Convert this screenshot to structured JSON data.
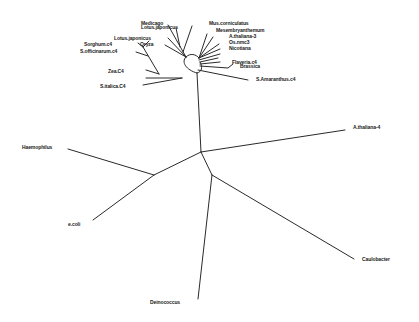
{
  "diagram": {
    "type": "unrooted-phylogenetic-tree",
    "colors": {
      "background": "#ffffff",
      "branch": "#2a2a2a",
      "label": "#1a1a1a"
    },
    "labels": {
      "lotus_top": "Lotus.japonicus",
      "medicago_top": "Medicago",
      "mus": "Mus.corniculatus",
      "mesembry": "Mesembryanthemum",
      "athaliana3": "A.thaliana-3",
      "os": "Os.nmc3",
      "nicotiana": "Nicotiana",
      "lotus": "Lotus.japonicus",
      "oryza": "Oryza",
      "sorghum": "Sorghum.c4",
      "soff": "S.officinarum.c4",
      "flaveria": "Flaveria.c4",
      "brassica": "Brassica",
      "amaranthus": "S.Amaranthus.c4",
      "zea": "Zea.C4",
      "setaria": "S.italica.C4",
      "athaliana4": "A.thaliana-4",
      "haemophilus": "Haemophilus",
      "ecoli": "e.coli",
      "caulobacter": "Caulobacter",
      "deinococcus": "Deinococcus"
    }
  }
}
